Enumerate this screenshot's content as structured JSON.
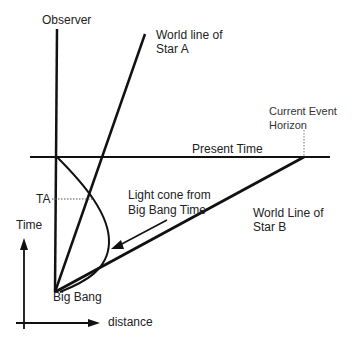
{
  "diagram": {
    "labels": {
      "observer": "Observer",
      "star_a_line1": "World line of",
      "star_a_line2": "Star A",
      "event_horizon_line1": "Current Event",
      "event_horizon_line2": "Horizon",
      "present_time": "Present Time",
      "ta": "TA",
      "light_cone_line1": "Light cone from",
      "light_cone_line2": "Big Bang Time",
      "star_b_line1": "World Line of",
      "star_b_line2": "Star B",
      "time_axis": "Time",
      "big_bang": "Big Bang",
      "distance_axis": "distance"
    },
    "colors": {
      "line": "#111111",
      "text": "#222222",
      "dotted": "#555555",
      "background": "#ffffff"
    }
  }
}
